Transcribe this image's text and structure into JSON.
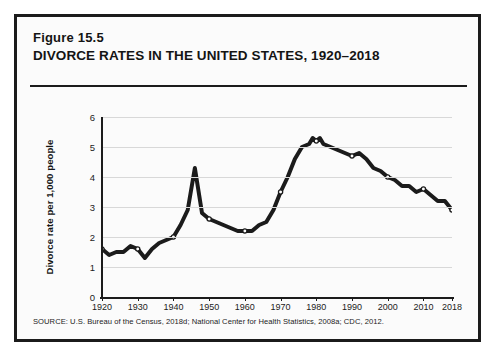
{
  "figure": {
    "number_label": "Figure 15.5",
    "title": "DIVORCE RATES IN THE UNITED STATES, 1920–2018",
    "source_note": "SOURCE: U.S. Bureau of the Census, 2018d; National Center for Health Statistics, 2008a; CDC, 2012."
  },
  "colors": {
    "panel_border": "#1b1b1b",
    "panel_background": "#fbfbfb",
    "line": "#1b1b1b",
    "marker_fill": "#ffffff",
    "gridline": "#d8d8d8",
    "axis": "#1b1b1b"
  },
  "chart_data": {
    "type": "line",
    "title": "DIVORCE RATES IN THE UNITED STATES, 1920–2018",
    "xlabel": "",
    "ylabel": "Divorce rate per 1,000 people",
    "xlim": [
      1920,
      2018
    ],
    "ylim": [
      0,
      6
    ],
    "grid": "horizontal",
    "legend": "none",
    "ytick_labels": [
      "0",
      "1",
      "2",
      "3",
      "4",
      "5",
      "6"
    ],
    "yticks": [
      0,
      1,
      2,
      3,
      4,
      5,
      6
    ],
    "xtick_labels": [
      "1920",
      "1930",
      "1940",
      "1950",
      "1960",
      "1970",
      "1980",
      "1990",
      "2000",
      "2010",
      "2018"
    ],
    "xticks": [
      1920,
      1930,
      1940,
      1950,
      1960,
      1970,
      1980,
      1990,
      2000,
      2010,
      2018
    ],
    "marker_years": [
      1920,
      1930,
      1940,
      1950,
      1960,
      1970,
      1980,
      1990,
      2000,
      2010,
      2018
    ],
    "x": [
      1920,
      1922,
      1924,
      1926,
      1928,
      1930,
      1932,
      1934,
      1936,
      1938,
      1940,
      1942,
      1944,
      1946,
      1948,
      1950,
      1952,
      1954,
      1956,
      1958,
      1960,
      1962,
      1964,
      1966,
      1968,
      1970,
      1972,
      1974,
      1976,
      1978,
      1979,
      1980,
      1981,
      1982,
      1984,
      1986,
      1988,
      1990,
      1992,
      1994,
      1996,
      1998,
      2000,
      2002,
      2004,
      2006,
      2008,
      2010,
      2012,
      2014,
      2016,
      2018
    ],
    "y": [
      1.6,
      1.4,
      1.5,
      1.5,
      1.7,
      1.6,
      1.3,
      1.6,
      1.8,
      1.9,
      2.0,
      2.4,
      2.9,
      4.3,
      2.8,
      2.6,
      2.5,
      2.4,
      2.3,
      2.2,
      2.2,
      2.2,
      2.4,
      2.5,
      2.9,
      3.5,
      4.0,
      4.6,
      5.0,
      5.1,
      5.3,
      5.2,
      5.3,
      5.1,
      5.0,
      4.9,
      4.8,
      4.7,
      4.8,
      4.6,
      4.3,
      4.2,
      4.0,
      3.9,
      3.7,
      3.7,
      3.5,
      3.6,
      3.4,
      3.2,
      3.2,
      2.9
    ]
  }
}
